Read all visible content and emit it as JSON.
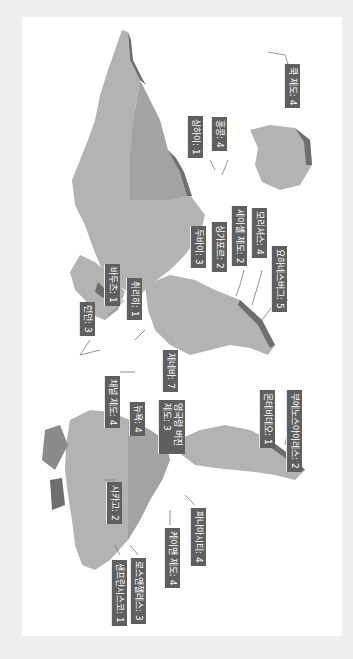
{
  "map": {
    "orientation": "rotated-90-clockwise",
    "colors": {
      "background": "#efefef",
      "panel": "#ffffff",
      "land_light": "#b3b3b3",
      "land_mid": "#a3a3a3",
      "land_shadow": "#6e6e6e",
      "label_bg": "#5f5f5f",
      "label_text": "#ffffff",
      "leader_line": "#777777"
    },
    "labels": [
      {
        "id": "cook-islands",
        "text": "쿡 제도: 4",
        "x": 300,
        "y": 64
      },
      {
        "id": "shanghai",
        "text": "상하이: 1",
        "x": 203,
        "y": 116
      },
      {
        "id": "hong-kong",
        "text": "홍콩: 4",
        "x": 227,
        "y": 117
      },
      {
        "id": "dubai",
        "text": "두바이: 3",
        "x": 206,
        "y": 226
      },
      {
        "id": "singapore",
        "text": "싱가포르: 2",
        "x": 227,
        "y": 222
      },
      {
        "id": "seychelles",
        "text": "세이셸 제도: 2",
        "x": 247,
        "y": 206
      },
      {
        "id": "mauritius",
        "text": "모리셔스: 4",
        "x": 267,
        "y": 208
      },
      {
        "id": "johannesburg",
        "text": "요하네스버그: 5",
        "x": 287,
        "y": 246
      },
      {
        "id": "bahrain",
        "text": "바두츠: 1",
        "x": 120,
        "y": 264
      },
      {
        "id": "zurich",
        "text": "취리히: 1",
        "x": 142,
        "y": 278
      },
      {
        "id": "london",
        "text": "런던: 3",
        "x": 95,
        "y": 302
      },
      {
        "id": "geneva",
        "text": "제네바: 7",
        "x": 178,
        "y": 350
      },
      {
        "id": "channel-islands",
        "text": "채널 제도: 4",
        "x": 120,
        "y": 376
      },
      {
        "id": "new-york",
        "text": "뉴욕: 4",
        "x": 145,
        "y": 402
      },
      {
        "id": "bvi",
        "text": "영국령 버진 제도: 3",
        "x": 185,
        "y": 400
      },
      {
        "id": "montevideo",
        "text": "몬테비데오: 1",
        "x": 275,
        "y": 390
      },
      {
        "id": "buenos-aires",
        "text": "부에노스아이레스: 2",
        "x": 302,
        "y": 390
      },
      {
        "id": "chicago",
        "text": "시카고: 2",
        "x": 122,
        "y": 482
      },
      {
        "id": "panama-city",
        "text": "파나마시티: 4",
        "x": 206,
        "y": 508
      },
      {
        "id": "cayman",
        "text": "케이맨 제도: 4",
        "x": 180,
        "y": 528
      },
      {
        "id": "san-francisco",
        "text": "샌프란시스코: 1",
        "x": 127,
        "y": 560
      },
      {
        "id": "los-angeles",
        "text": "로스앤젤레스: 3",
        "x": 146,
        "y": 558
      }
    ]
  }
}
